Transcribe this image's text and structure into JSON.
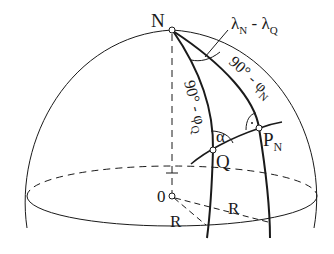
{
  "diagram": {
    "labels": {
      "north_pole": "N",
      "angle_top_lambda": "λ",
      "angle_top_sub1": "N",
      "angle_top_minus": " - ",
      "angle_top_lambda2": "λ",
      "angle_top_sub2": "Q",
      "arc_right_prefix": "90° - φ",
      "arc_right_sub": "N",
      "arc_left": "90° - φ",
      "arc_left_sub": "Q",
      "alpha": "α",
      "point_q": "Q",
      "point_p": "P",
      "point_p_sub": "N",
      "center": "0",
      "radius_left": "R",
      "radius_right": "R"
    },
    "colors": {
      "line": "#1a1a1a",
      "background": "#ffffff"
    }
  }
}
